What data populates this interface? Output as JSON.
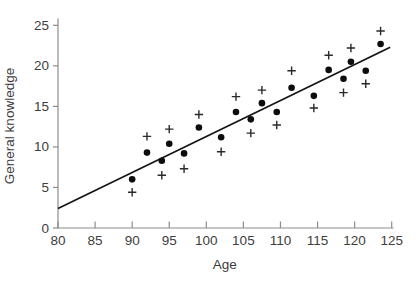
{
  "figure": {
    "xlabel": "Age",
    "ylabel": "General knowledge"
  },
  "styles": {
    "background": "#ffffff",
    "axis_color": "#8c8c8c",
    "tick_label_color": "#3d3d3d",
    "axis_title_color": "#3b3b3b",
    "dot_color": "#0d0d0d",
    "plus_color": "#2a2a2a",
    "fit_line_color": "#141414"
  },
  "chart_data": {
    "type": "scatter",
    "title": "",
    "xlabel": "Age",
    "ylabel": "General knowledge",
    "xlim": [
      80,
      125
    ],
    "ylim": [
      0,
      25
    ],
    "x_ticks": [
      80,
      85,
      90,
      95,
      100,
      105,
      110,
      115,
      120,
      125
    ],
    "y_ticks": [
      0,
      5,
      10,
      15,
      20,
      25
    ],
    "grid": false,
    "legend_position": "none",
    "x": [
      90,
      92,
      94,
      95,
      97,
      99,
      102,
      104,
      106,
      107.5,
      109.5,
      111.5,
      114.5,
      116.5,
      118.5,
      119.5,
      121.5,
      123.5
    ],
    "series": [
      {
        "name": "filled-circles",
        "marker": "circle",
        "values": [
          6.0,
          9.3,
          8.3,
          10.4,
          9.2,
          12.4,
          11.2,
          14.3,
          13.4,
          15.4,
          14.3,
          17.3,
          16.3,
          19.5,
          18.4,
          20.5,
          19.4,
          22.7
        ]
      },
      {
        "name": "plus-marks",
        "marker": "plus",
        "values": [
          4.4,
          11.3,
          6.5,
          12.2,
          7.3,
          14.0,
          9.4,
          16.2,
          11.7,
          17.0,
          12.7,
          19.4,
          14.8,
          21.3,
          16.7,
          22.2,
          17.8,
          24.3
        ]
      }
    ],
    "fit_line": {
      "x1": 80,
      "y1": 2.4,
      "x2": 124.8,
      "y2": 22.3
    }
  }
}
